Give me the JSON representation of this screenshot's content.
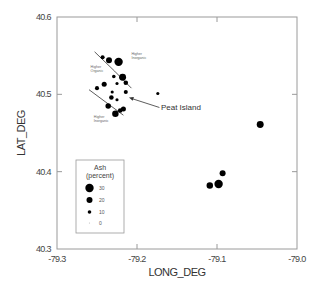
{
  "chart_data": {
    "type": "scatter",
    "title": "",
    "xlabel": "LONG_DEG",
    "ylabel": "LAT_DEG",
    "xlim": [
      -79.3,
      -79.0
    ],
    "ylim": [
      40.3,
      40.6
    ],
    "grid": false,
    "x_ticks": [
      "-79.3",
      "-79.2",
      "-79.1",
      "-79.0"
    ],
    "y_ticks": [
      "40.3",
      "40.4",
      "40.5",
      "40.6"
    ],
    "size_variable": "Ash (percent)",
    "legend": {
      "title": "Ash",
      "subtitle": "(percent)",
      "position": "lower-left",
      "entries": [
        {
          "label": "30",
          "ash": 30
        },
        {
          "label": "20",
          "ash": 20
        },
        {
          "label": "10",
          "ash": 10
        },
        {
          "label": "0",
          "ash": 0
        }
      ]
    },
    "points": [
      {
        "lon": -79.243,
        "lat": 40.548,
        "ash": 12
      },
      {
        "lon": -79.235,
        "lat": 40.544,
        "ash": 20
      },
      {
        "lon": -79.223,
        "lat": 40.542,
        "ash": 30
      },
      {
        "lon": -79.229,
        "lat": 40.523,
        "ash": 10
      },
      {
        "lon": -79.218,
        "lat": 40.522,
        "ash": 24
      },
      {
        "lon": -79.241,
        "lat": 40.513,
        "ash": 16
      },
      {
        "lon": -79.25,
        "lat": 40.508,
        "ash": 12
      },
      {
        "lon": -79.225,
        "lat": 40.514,
        "ash": 8
      },
      {
        "lon": -79.214,
        "lat": 40.515,
        "ash": 14
      },
      {
        "lon": -79.231,
        "lat": 40.503,
        "ash": 8
      },
      {
        "lon": -79.214,
        "lat": 40.503,
        "ash": 12
      },
      {
        "lon": -79.232,
        "lat": 40.496,
        "ash": 14
      },
      {
        "lon": -79.225,
        "lat": 40.493,
        "ash": 8
      },
      {
        "lon": -79.236,
        "lat": 40.485,
        "ash": 18
      },
      {
        "lon": -79.227,
        "lat": 40.475,
        "ash": 22
      },
      {
        "lon": -79.217,
        "lat": 40.481,
        "ash": 16
      },
      {
        "lon": -79.221,
        "lat": 40.479,
        "ash": 14
      },
      {
        "lon": -79.174,
        "lat": 40.501,
        "ash": 8
      },
      {
        "lon": -79.046,
        "lat": 40.461,
        "ash": 24
      },
      {
        "lon": -79.093,
        "lat": 40.398,
        "ash": 20
      },
      {
        "lon": -79.098,
        "lat": 40.384,
        "ash": 30
      },
      {
        "lon": -79.109,
        "lat": 40.382,
        "ash": 22
      }
    ],
    "boundary_lines": [
      {
        "name": "upper-boundary",
        "points": [
          [
            -79.253,
            40.555
          ],
          [
            -79.228,
            40.53
          ],
          [
            -79.207,
            40.508
          ]
        ]
      },
      {
        "name": "lower-boundary",
        "points": [
          [
            -79.26,
            40.506
          ],
          [
            -79.217,
            40.473
          ]
        ]
      }
    ],
    "annotations": [
      {
        "text": [
          "Higher",
          "Inorganic"
        ],
        "lon": -79.207,
        "lat": 40.551
      },
      {
        "text": [
          "Higher",
          "Organic"
        ],
        "lon": -79.258,
        "lat": 40.534
      },
      {
        "text": [
          "Higher",
          "Inorganic"
        ],
        "lon": -79.254,
        "lat": 40.47
      }
    ],
    "callout": {
      "text": "Peat Island",
      "arrow_from": [
        -79.172,
        40.483
      ],
      "arrow_to": [
        -79.21,
        40.496
      ]
    }
  }
}
